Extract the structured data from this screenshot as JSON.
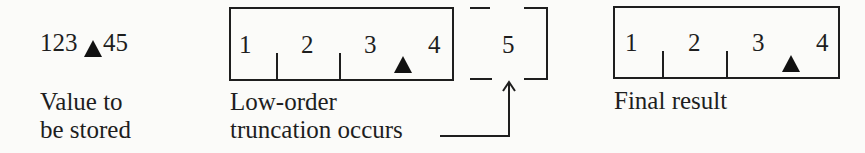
{
  "value_to_store": {
    "prefix": "123",
    "suffix": "45",
    "marker": "decimal-point-triangle",
    "caption_line1": "Value to",
    "caption_line2": "be stored"
  },
  "storage_box": {
    "digits": [
      "1",
      "2",
      "3",
      "4"
    ],
    "caption_line1": "Low-order",
    "caption_line2": "truncation occurs"
  },
  "truncated_box": {
    "digit": "5",
    "style": "dashed"
  },
  "final_result": {
    "digits": [
      "1",
      "2",
      "3",
      "4"
    ],
    "caption": "Final result"
  }
}
